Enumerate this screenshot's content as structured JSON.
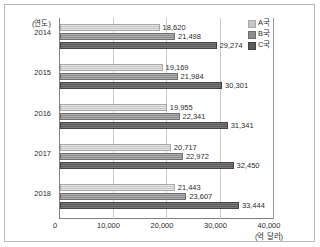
{
  "chart_data": {
    "type": "bar",
    "orientation": "horizontal",
    "title": "",
    "xlabel": "(억 달러)",
    "ylabel": "(연도)",
    "categories": [
      "2014",
      "2015",
      "2016",
      "2017",
      "2018"
    ],
    "series": [
      {
        "name": "A국",
        "color": "#c6c6c6",
        "values": [
          18620,
          19169,
          19955,
          20717,
          21443
        ],
        "labels": [
          "18,620",
          "19,169",
          "19,955",
          "20,717",
          "21,443"
        ]
      },
      {
        "name": "B국",
        "color": "#8d8d8d",
        "values": [
          21498,
          21984,
          22341,
          22972,
          23607
        ],
        "labels": [
          "21,498",
          "21,984",
          "22,341",
          "22,972",
          "23,607"
        ]
      },
      {
        "name": "C국",
        "color": "#5a5a5a",
        "values": [
          29274,
          30301,
          31341,
          32450,
          33444
        ],
        "labels": [
          "29,274",
          "30,301",
          "31,341",
          "32,450",
          "33,444"
        ]
      }
    ],
    "xlim": [
      0,
      40000
    ],
    "xticks": [
      0,
      10000,
      20000,
      30000,
      40000
    ],
    "xtick_labels": [
      "0",
      "10,000",
      "20,000",
      "30,000",
      "40,000"
    ],
    "grid": true,
    "grid_axis": "x",
    "legend_position": "top-right"
  },
  "axis": {
    "year_unit": "(연도)",
    "value_unit": "(억 달러)"
  },
  "legend": {
    "items": [
      {
        "label": "A국"
      },
      {
        "label": "B국"
      },
      {
        "label": "C국"
      }
    ]
  }
}
